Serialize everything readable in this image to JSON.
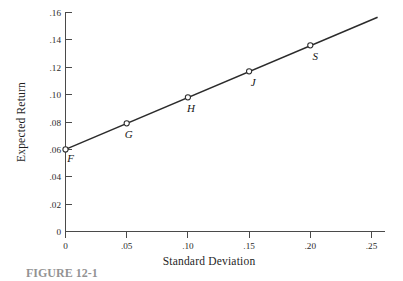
{
  "figure": {
    "caption": "FIGURE 12-1",
    "background_color": "#ffffff",
    "ink_color": "#2b2b2b",
    "axis_color": "#4a4a4a"
  },
  "chart_data": {
    "type": "line",
    "title": "",
    "subtitle": "",
    "xlabel": "Standard Deviation",
    "ylabel": "Expected Return",
    "xlim": [
      0,
      0.25
    ],
    "ylim": [
      0,
      0.16
    ],
    "grid": false,
    "legend": "none",
    "x_ticks": [
      0,
      0.05,
      0.1,
      0.15,
      0.2,
      0.25
    ],
    "x_tick_labels": [
      "0",
      ".05",
      ".10",
      ".15",
      ".20",
      ".25"
    ],
    "y_ticks": [
      0,
      0.02,
      0.04,
      0.06,
      0.08,
      0.1,
      0.12,
      0.14,
      0.16
    ],
    "y_tick_labels": [
      "0",
      ".02",
      ".04",
      ".06",
      ".08",
      ".10",
      ".12",
      ".14",
      ".16"
    ],
    "series": [
      {
        "name": "Capital Market Line",
        "style": "solid",
        "color": "#2b2b2b",
        "line_x": [
          0,
          0.255
        ],
        "line_y": [
          0.06,
          0.1565
        ],
        "points": [
          {
            "label": "F",
            "x": 0,
            "y": 0.06,
            "label_dx": 5,
            "label_dy": 13
          },
          {
            "label": "G",
            "x": 0.05,
            "y": 0.079,
            "label_dx": 2,
            "label_dy": 15
          },
          {
            "label": "H",
            "x": 0.1,
            "y": 0.098,
            "label_dx": 3,
            "label_dy": 15
          },
          {
            "label": "J",
            "x": 0.15,
            "y": 0.117,
            "label_dx": 4,
            "label_dy": 15
          },
          {
            "label": "S",
            "x": 0.2,
            "y": 0.136,
            "label_dx": 5,
            "label_dy": 15
          }
        ]
      }
    ],
    "annotations": []
  }
}
